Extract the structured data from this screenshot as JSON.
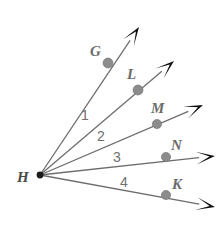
{
  "diagram": {
    "kind": "angle-ray-diagram",
    "vertex": {
      "name": "H",
      "label": "H",
      "x": 40,
      "y": 175,
      "label_x": 17,
      "label_y": 182
    },
    "colors": {
      "background": "#ffffff",
      "ray_stroke": "#6d6d6d",
      "arrowhead_fill": "#111111",
      "point_dot_fill": "#8c8c8c",
      "point_label_fill": "#6b6b6b",
      "vertex_label_fill": "#4a4a4a",
      "angle_label_fill": "#6f6f6f"
    },
    "rays": [
      {
        "id": "ray-HG",
        "point_label": "G",
        "point_x": 108,
        "point_y": 63,
        "point_label_x": 90,
        "point_label_y": 56,
        "tip_x": 139,
        "tip_y": 27,
        "dot_r": 5.0
      },
      {
        "id": "ray-HL",
        "point_label": "L",
        "point_x": 138,
        "point_y": 90,
        "point_label_x": 127,
        "point_label_y": 79,
        "tip_x": 174,
        "tip_y": 61,
        "dot_r": 5.0
      },
      {
        "id": "ray-HM",
        "point_label": "M",
        "point_x": 157,
        "point_y": 124,
        "point_label_x": 151,
        "point_label_y": 113,
        "tip_x": 203,
        "tip_y": 105,
        "dot_r": 4.6
      },
      {
        "id": "ray-HN",
        "point_label": "N",
        "point_x": 166,
        "point_y": 157,
        "point_label_x": 171,
        "point_label_y": 150,
        "tip_x": 215,
        "tip_y": 156,
        "dot_r": 4.6
      },
      {
        "id": "ray-HK",
        "point_label": "K",
        "point_x": 166,
        "point_y": 195,
        "point_label_x": 172,
        "point_label_y": 189,
        "tip_x": 215,
        "tip_y": 207,
        "dot_r": 4.6
      }
    ],
    "angles": [
      {
        "id": "angle-1",
        "label": "1",
        "x": 81,
        "y": 120,
        "between": "G-L"
      },
      {
        "id": "angle-2",
        "label": "2",
        "x": 97,
        "y": 141,
        "between": "L-M"
      },
      {
        "id": "angle-3",
        "label": "3",
        "x": 113,
        "y": 162,
        "between": "M-N"
      },
      {
        "id": "angle-4",
        "label": "4",
        "x": 120,
        "y": 187,
        "between": "N-K"
      }
    ]
  },
  "chart_data": {
    "type": "diagram",
    "title": "",
    "vertex": "H",
    "ray_endpoints": [
      "G",
      "L",
      "M",
      "N",
      "K"
    ],
    "angle_labels": [
      "1",
      "2",
      "3",
      "4"
    ]
  }
}
